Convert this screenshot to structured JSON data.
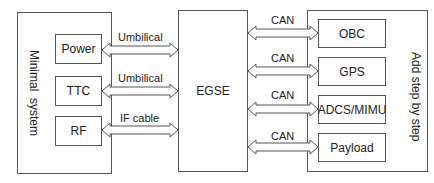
{
  "left_group": {
    "title_line1": "Minimal",
    "title_line2": "system",
    "modules": [
      {
        "label": "Power"
      },
      {
        "label": "TTC"
      },
      {
        "label": "RF"
      }
    ]
  },
  "center": {
    "label": "EGSE"
  },
  "right_group": {
    "title": "Add step by step",
    "modules": [
      {
        "label": "OBC"
      },
      {
        "label": "GPS"
      },
      {
        "label": "ADCS/MIMU"
      },
      {
        "label": "Payload"
      }
    ]
  },
  "left_links": [
    {
      "label": "Umbilical"
    },
    {
      "label": "Umbilical"
    },
    {
      "label": "IF cable"
    }
  ],
  "right_links": [
    {
      "label": "CAN"
    },
    {
      "label": "CAN"
    },
    {
      "label": "CAN"
    },
    {
      "label": "CAN"
    }
  ],
  "colors": {
    "stroke": "#555555",
    "fill": "#ffffff",
    "text": "#222222"
  }
}
